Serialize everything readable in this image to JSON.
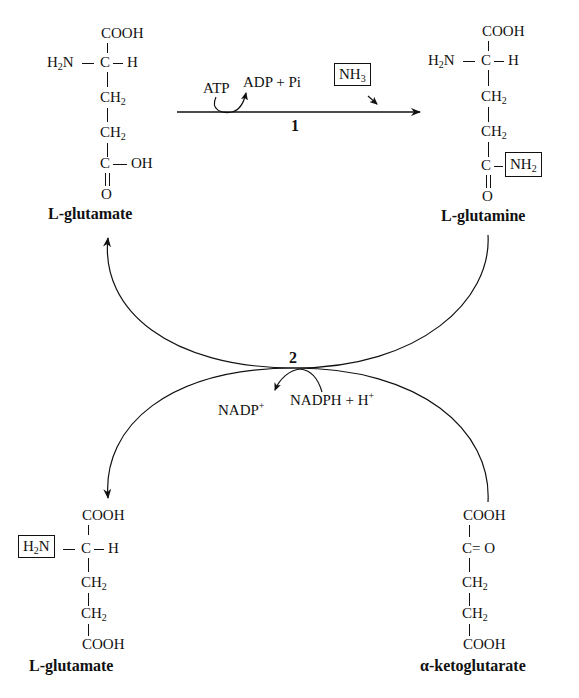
{
  "diagram": {
    "reaction_1": {
      "number": "1",
      "cofactor_in": "ATP",
      "cofactor_out": "ADP + Pi",
      "substrate_boxed": "NH3"
    },
    "reaction_2": {
      "number": "2",
      "cofactor_in": "NADPH + H+",
      "cofactor_out": "NADP+"
    },
    "molecules": {
      "top_left": {
        "name": "L-glutamate",
        "rows": [
          "COOH",
          "H2N—C—H",
          "CH2",
          "CH2",
          "C—OH",
          "O"
        ]
      },
      "top_right": {
        "name": "L-glutamine",
        "rows": [
          "COOH",
          "H2N—C—H",
          "CH2",
          "CH2",
          "C—NH2",
          "O"
        ],
        "boxed_group": "NH2"
      },
      "bottom_left": {
        "name": "L-glutamate",
        "rows": [
          "COOH",
          "H2N—C—H",
          "CH2",
          "CH2",
          "COOH"
        ],
        "boxed_group": "H2N"
      },
      "bottom_right": {
        "name": "α-ketoglutarate",
        "rows": [
          "COOH",
          "C= O",
          "CH2",
          "CH2",
          "COOH"
        ]
      }
    }
  }
}
